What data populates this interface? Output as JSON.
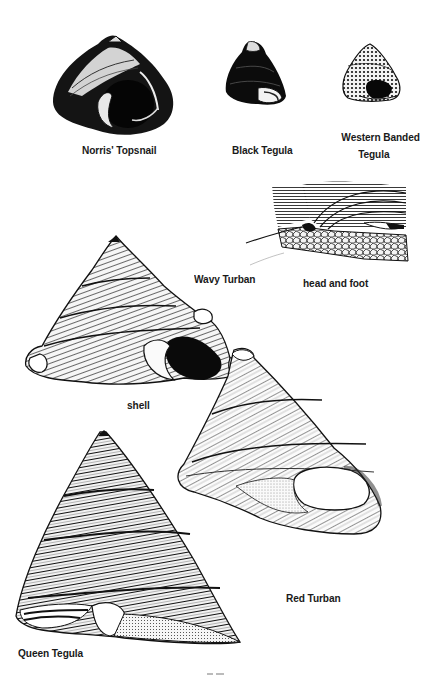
{
  "page": {
    "background": "#ffffff",
    "ink_color": "#141414"
  },
  "illustrations": [
    {
      "id": "norris-topsnail",
      "label": "Norris' Topsnail"
    },
    {
      "id": "black-tegula",
      "label": "Black Tegula"
    },
    {
      "id": "western-banded-tegula",
      "label_lines": [
        "Western Banded",
        "Tegula"
      ]
    },
    {
      "id": "wavy-turban",
      "label": "Wavy Turban",
      "views": [
        {
          "id": "head-and-foot",
          "label": "head and foot"
        },
        {
          "id": "shell",
          "label": "shell"
        }
      ]
    },
    {
      "id": "red-turban",
      "label": "Red Turban"
    },
    {
      "id": "queen-tegula",
      "label": "Queen Tegula"
    }
  ],
  "footer": {
    "page_number_visible": "partial (cut off)"
  }
}
